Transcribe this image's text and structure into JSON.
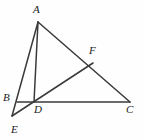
{
  "figure": {
    "stroke_color": "#3a3a3a",
    "label_color": "#1a1a1a",
    "background_color": "#fefefe",
    "canvas": {
      "width": 144,
      "height": 140
    },
    "points": [
      {
        "id": "A",
        "label": "A",
        "x": 38,
        "y": 22,
        "label_x": 33,
        "label_y": 4
      },
      {
        "id": "B",
        "label": "B",
        "x": 17,
        "y": 102,
        "label_x": 3,
        "label_y": 92
      },
      {
        "id": "C",
        "label": "C",
        "x": 130,
        "y": 102,
        "label_x": 126,
        "label_y": 104
      },
      {
        "id": "D",
        "label": "D",
        "x": 34,
        "y": 102,
        "label_x": 34,
        "label_y": 104
      },
      {
        "id": "E",
        "label": "E",
        "x": 12,
        "y": 116,
        "label_x": 11,
        "label_y": 124
      },
      {
        "id": "F",
        "label": "F",
        "x": 93,
        "y": 63,
        "label_x": 89,
        "label_y": 45
      }
    ],
    "segments": [
      {
        "id": "AE",
        "from": "A",
        "to": "E",
        "note": "line from A through B down to E"
      },
      {
        "id": "AD",
        "from": "A",
        "to": "D",
        "note": "cevian from A to D on BC"
      },
      {
        "id": "AC",
        "from": "A",
        "to": "C",
        "note": "side AC passing through F"
      },
      {
        "id": "BC",
        "from": "B",
        "to": "C",
        "note": "base line through D"
      },
      {
        "id": "EF",
        "from": "E",
        "to": "F",
        "note": "line from E through D up to F"
      }
    ]
  }
}
